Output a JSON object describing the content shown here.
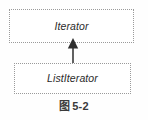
{
  "figure": {
    "caption_glyph": "图",
    "caption_number": "5-2",
    "background_color": "#fefefe",
    "border_color": "#9a9a9a",
    "text_color": "#2b2b2b",
    "arrow_color": "#3a3a3a"
  },
  "diagram": {
    "type": "uml-class-diagram",
    "relationship": "generalization",
    "nodes": [
      {
        "id": "iterator",
        "label": "Iterator",
        "stereotype": "interface",
        "style": "italic",
        "border": "dotted"
      },
      {
        "id": "listiterator",
        "label": "ListIterator",
        "stereotype": "interface",
        "style": "italic",
        "border": "dotted"
      }
    ],
    "edges": [
      {
        "from": "listiterator",
        "to": "iterator",
        "kind": "generalization",
        "arrowhead": "solid-triangle",
        "direction": "up"
      }
    ]
  }
}
